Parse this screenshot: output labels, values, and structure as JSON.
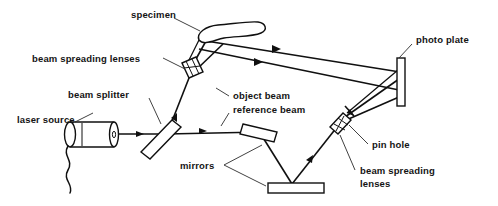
{
  "diagram": {
    "background_color": "#ffffff",
    "ink_color": "#101010",
    "labels": {
      "specimen": "specimen",
      "beam_spreading_lenses_left": "beam spreading lenses",
      "beam_splitter": "beam splitter",
      "laser_source": "laser source",
      "object_beam": "object beam",
      "reference_beam": "reference beam",
      "photo_plate": "photo plate",
      "pin_hole": "pin hole",
      "beam_spreading_lenses_right_line1": "beam spreading",
      "beam_spreading_lenses_right_line2": "lenses",
      "mirrors": "mirrors"
    },
    "components": [
      {
        "name": "laser-source",
        "type": "cylinder",
        "label": "laser source"
      },
      {
        "name": "beam-splitter",
        "type": "tilted-plate",
        "label": "beam splitter"
      },
      {
        "name": "beam-spreading-lenses-left",
        "type": "lens-block",
        "label": "beam spreading lenses"
      },
      {
        "name": "specimen",
        "type": "blob",
        "label": "specimen"
      },
      {
        "name": "photo-plate",
        "type": "vertical-plate",
        "label": "photo plate"
      },
      {
        "name": "mirror-tilted",
        "type": "tilted-mirror",
        "label": "mirrors"
      },
      {
        "name": "mirror-horizontal",
        "type": "flat-mirror",
        "label": "mirrors"
      },
      {
        "name": "beam-spreading-lenses-right",
        "type": "lens-block",
        "label": "beam spreading lenses"
      },
      {
        "name": "pin-hole",
        "type": "aperture",
        "label": "pin hole"
      }
    ],
    "beams": [
      {
        "name": "laser-to-splitter",
        "label": "laser source output"
      },
      {
        "name": "splitter-to-left-lenses",
        "label": "object beam leg"
      },
      {
        "name": "left-lenses-to-specimen",
        "label": "object beam spread"
      },
      {
        "name": "specimen-to-photo-plate",
        "label": "object beam"
      },
      {
        "name": "splitter-to-tilted-mirror",
        "label": "reference beam"
      },
      {
        "name": "tilted-mirror-to-flat-mirror",
        "label": "reference beam"
      },
      {
        "name": "flat-mirror-to-right-lenses",
        "label": "reference beam"
      },
      {
        "name": "right-lenses-to-photo-plate",
        "label": "reference beam spread"
      }
    ]
  }
}
